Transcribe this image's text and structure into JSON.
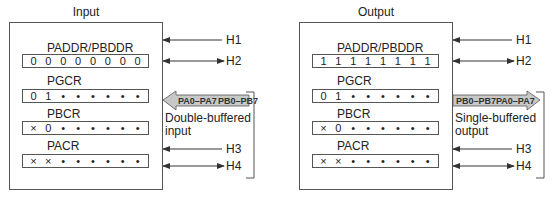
{
  "panels": [
    {
      "title": "Input",
      "registers": [
        {
          "name": "PADDR/PBDDR",
          "bits": [
            "0",
            "0",
            "0",
            "0",
            "0",
            "0",
            "0",
            "0"
          ]
        },
        {
          "name": "PGCR",
          "bits": [
            "0",
            "1",
            "•",
            "•",
            "•",
            "•",
            "•",
            "•"
          ]
        },
        {
          "name": "PBCR",
          "bits": [
            "×",
            "0",
            "•",
            "•",
            "•",
            "•",
            "•",
            "•"
          ]
        },
        {
          "name": "PACR",
          "bits": [
            "×",
            "×",
            "•",
            "•",
            "•",
            "•",
            "•",
            "•"
          ]
        }
      ],
      "handshake": [
        "H1",
        "H2",
        "H3",
        "H4"
      ],
      "data_arrow": {
        "direction": "in",
        "left_label": "PA0–PA7",
        "right_label": "PB0–PB7"
      },
      "note_line1": "Double-buffered",
      "note_line2": "input"
    },
    {
      "title": "Output",
      "registers": [
        {
          "name": "PADDR/PBDDR",
          "bits": [
            "1",
            "1",
            "1",
            "1",
            "1",
            "1",
            "1",
            "1"
          ]
        },
        {
          "name": "PGCR",
          "bits": [
            "0",
            "1",
            "•",
            "•",
            "•",
            "•",
            "•",
            "•"
          ]
        },
        {
          "name": "PBCR",
          "bits": [
            "×",
            "0",
            "•",
            "•",
            "•",
            "•",
            "•",
            "•"
          ]
        },
        {
          "name": "PACR",
          "bits": [
            "×",
            "×",
            "•",
            "•",
            "•",
            "•",
            "•",
            "•"
          ]
        }
      ],
      "handshake": [
        "H1",
        "H2",
        "H3",
        "H4"
      ],
      "data_arrow": {
        "direction": "out",
        "left_label": "PB0–PB7",
        "right_label": "PA0–PA7"
      },
      "note_line1": "Single-buffered",
      "note_line2": "output"
    }
  ],
  "colors": {
    "arrow_fill": "#c8c8c8",
    "line": "#444444"
  }
}
